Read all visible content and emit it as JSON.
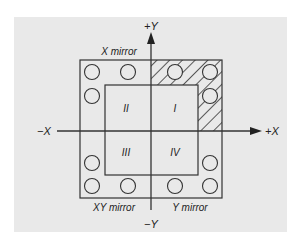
{
  "diagram": {
    "colors": {
      "page": "#ffffff",
      "panel": "#e9e9e9",
      "stroke": "#333333",
      "hatch": "#333333"
    },
    "axes": {
      "plus_x": "+X",
      "minus_x": "−X",
      "plus_y": "+Y",
      "minus_y": "−Y"
    },
    "quadrants": {
      "q1": "I",
      "q2": "II",
      "q3": "III",
      "q4": "IV"
    },
    "mirror_labels": {
      "x_mirror": "X mirror",
      "xy_mirror": "XY mirror",
      "y_mirror": "Y mirror"
    },
    "hatched_quadrant": "I",
    "circle_count": 12
  }
}
